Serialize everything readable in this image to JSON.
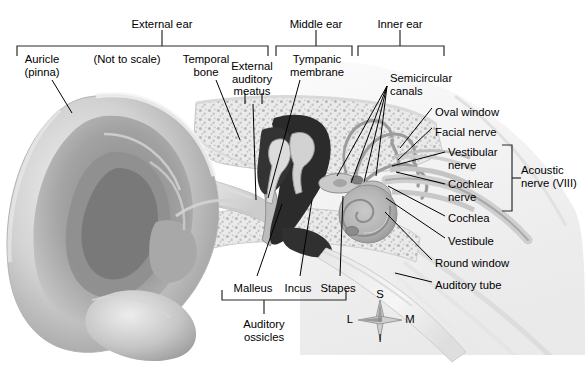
{
  "figure": {
    "note": "(Not to scale)",
    "ink_color": "#000000",
    "background_color": "#ffffff"
  },
  "region_brackets": [
    {
      "name": "external-ear",
      "label": "External ear",
      "label_x": 162,
      "label_y": 18,
      "stem_x": 162,
      "bracket_left": 17,
      "bracket_right": 268,
      "bracket_y": 46,
      "stem_top": 30
    },
    {
      "name": "middle-ear",
      "label": "Middle ear",
      "label_x": 316,
      "label_y": 18,
      "stem_x": 316,
      "bracket_left": 276,
      "bracket_right": 352,
      "bracket_y": 46,
      "stem_top": 30
    },
    {
      "name": "inner-ear",
      "label": "Inner ear",
      "label_x": 400,
      "label_y": 18,
      "stem_x": 400,
      "bracket_left": 358,
      "bracket_right": 444,
      "bracket_y": 46,
      "stem_top": 30
    }
  ],
  "ossicle_bracket": {
    "name": "auditory-ossicles",
    "label_line1": "Auditory",
    "label_line2": "ossicles",
    "label_x": 264,
    "label_y": 318,
    "bracket_left": 222,
    "bracket_right": 346,
    "bracket_y": 300,
    "stem_x": 264,
    "stem_bottom": 314
  },
  "acoustic_bracket": {
    "name": "acoustic-nerve",
    "label_line1": "Acoustic",
    "label_line2": "nerve (VIII)",
    "label_x": 521,
    "label_y": 164,
    "bracket_top": 145,
    "bracket_bottom": 211,
    "bracket_x": 512,
    "stem_y": 178,
    "stem_right": 521
  },
  "labels_top_left": [
    {
      "name": "auricle",
      "line1": "Auricle",
      "line2": "(pinna)",
      "x": 42,
      "y": 53
    },
    {
      "name": "not-to-scale",
      "line1": "(Not to scale)",
      "line2": "",
      "x": 127,
      "y": 53
    },
    {
      "name": "temporal-bone",
      "line1": "Temporal",
      "line2": "bone",
      "x": 206,
      "y": 53
    },
    {
      "name": "external-auditory-meatus",
      "line1": "External",
      "line2": "auditory",
      "line3": "meatus",
      "x": 252,
      "y": 60
    },
    {
      "name": "tympanic-membrane",
      "line1": "Tympanic",
      "line2": "membrane",
      "x": 317,
      "y": 53
    }
  ],
  "labels_right": [
    {
      "name": "semicircular-canals",
      "line1": "Semicircular",
      "line2": "canals",
      "x": 390,
      "y": 72
    },
    {
      "name": "oval-window",
      "line1": "Oval window",
      "line2": "",
      "x": 435,
      "y": 106
    },
    {
      "name": "facial-nerve",
      "line1": "Facial nerve",
      "line2": "",
      "x": 435,
      "y": 126
    },
    {
      "name": "vestibular-nerve",
      "line1": "Vestibular",
      "line2": "nerve",
      "x": 448,
      "y": 146
    },
    {
      "name": "cochlear-nerve",
      "line1": "Cochlear",
      "line2": "nerve",
      "x": 448,
      "y": 178
    },
    {
      "name": "cochlea",
      "line1": "Cochlea",
      "line2": "",
      "x": 448,
      "y": 212
    },
    {
      "name": "vestibule",
      "line1": "Vestibule",
      "line2": "",
      "x": 448,
      "y": 235
    },
    {
      "name": "round-window",
      "line1": "Round window",
      "line2": "",
      "x": 435,
      "y": 257
    },
    {
      "name": "auditory-tube",
      "line1": "Auditory tube",
      "line2": "",
      "x": 435,
      "y": 279
    }
  ],
  "labels_bottom": [
    {
      "name": "malleus",
      "label": "Malleus",
      "x": 253,
      "y": 282
    },
    {
      "name": "incus",
      "label": "Incus",
      "x": 298,
      "y": 282
    },
    {
      "name": "stapes",
      "label": "Stapes",
      "x": 338,
      "y": 282
    }
  ],
  "compass": {
    "name": "orientation-compass",
    "center_x": 380,
    "center_y": 320,
    "superior": "S",
    "inferior": "I",
    "lateral": "L",
    "medial": "M"
  },
  "leader_lines": [
    {
      "name": "leader-auricle",
      "x1": 52,
      "y1": 80,
      "x2": 72,
      "y2": 113
    },
    {
      "name": "leader-temporal-bone",
      "x1": 216,
      "y1": 80,
      "x2": 240,
      "y2": 140
    },
    {
      "name": "leader-eam-a",
      "x1": 245,
      "y1": 93,
      "x2": 245,
      "y2": 104
    },
    {
      "name": "leader-eam-b",
      "x1": 262,
      "y1": 93,
      "x2": 262,
      "y2": 104
    },
    {
      "name": "leader-eam-down",
      "x1": 253,
      "y1": 104,
      "x2": 256,
      "y2": 200
    },
    {
      "name": "leader-tympanic",
      "x1": 300,
      "y1": 80,
      "x2": 268,
      "y2": 198
    },
    {
      "name": "leader-sc-1",
      "x1": 387,
      "y1": 86,
      "x2": 337,
      "y2": 176
    },
    {
      "name": "leader-sc-2",
      "x1": 387,
      "y1": 86,
      "x2": 351,
      "y2": 183
    },
    {
      "name": "leader-sc-3",
      "x1": 387,
      "y1": 86,
      "x2": 364,
      "y2": 182
    },
    {
      "name": "leader-sc-4",
      "x1": 387,
      "y1": 86,
      "x2": 376,
      "y2": 176
    },
    {
      "name": "leader-oval-window",
      "x1": 432,
      "y1": 108,
      "x2": 400,
      "y2": 148
    },
    {
      "name": "leader-facial-nerve",
      "x1": 432,
      "y1": 128,
      "x2": 398,
      "y2": 160
    },
    {
      "name": "leader-vestibular",
      "x1": 445,
      "y1": 152,
      "x2": 392,
      "y2": 166
    },
    {
      "name": "leader-cochlear",
      "x1": 445,
      "y1": 184,
      "x2": 396,
      "y2": 172
    },
    {
      "name": "leader-cochlea",
      "x1": 445,
      "y1": 216,
      "x2": 388,
      "y2": 186
    },
    {
      "name": "leader-vestibule",
      "x1": 445,
      "y1": 238,
      "x2": 386,
      "y2": 198
    },
    {
      "name": "leader-round-window",
      "x1": 432,
      "y1": 260,
      "x2": 385,
      "y2": 212
    },
    {
      "name": "leader-auditory-tube",
      "x1": 432,
      "y1": 282,
      "x2": 395,
      "y2": 273
    },
    {
      "name": "leader-malleus",
      "x1": 257,
      "y1": 276,
      "x2": 282,
      "y2": 204
    },
    {
      "name": "leader-incus",
      "x1": 300,
      "y1": 276,
      "x2": 312,
      "y2": 200
    },
    {
      "name": "leader-stapes",
      "x1": 340,
      "y1": 276,
      "x2": 343,
      "y2": 196
    }
  ]
}
